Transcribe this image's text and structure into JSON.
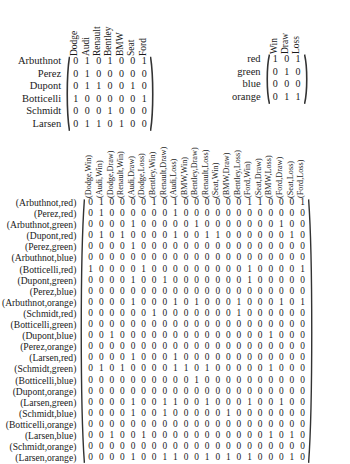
{
  "matrix_driver_car": {
    "name": "driver-car-incidence-matrix",
    "row_labels": [
      "Arbuthnot",
      "Perez",
      "Dupont",
      "Botticelli",
      "Schmidt",
      "Larsen"
    ],
    "col_labels": [
      "Dodge",
      "Audi",
      "Renault",
      "Bentley",
      "BMW",
      "Seat",
      "Ford"
    ],
    "values": [
      [
        0,
        1,
        0,
        1,
        0,
        0,
        1
      ],
      [
        0,
        1,
        0,
        0,
        0,
        0,
        0
      ],
      [
        0,
        1,
        1,
        0,
        0,
        1,
        0
      ],
      [
        1,
        0,
        0,
        0,
        0,
        0,
        1
      ],
      [
        0,
        0,
        0,
        1,
        0,
        0,
        0
      ],
      [
        0,
        1,
        1,
        0,
        1,
        0,
        0
      ]
    ]
  },
  "matrix_color_result": {
    "name": "color-result-incidence-matrix",
    "row_labels": [
      "red",
      "green",
      "blue",
      "orange"
    ],
    "col_labels": [
      "Win",
      "Draw",
      "Loss"
    ],
    "values": [
      [
        1,
        0,
        1
      ],
      [
        0,
        1,
        0
      ],
      [
        0,
        0,
        0
      ],
      [
        0,
        1,
        1
      ]
    ]
  },
  "matrix_pair": {
    "name": "pair-product-incidence-matrix",
    "row_labels": [
      "(Arbuthnot,red)",
      "(Perez,red)",
      "(Arbuthnot,green)",
      "(Dupont,red)",
      "(Perez,green)",
      "(Arbuthnot,blue)",
      "(Botticelli,red)",
      "(Dupont,green)",
      "(Perez,blue)",
      "(Arbuthnot,orange)",
      "(Schmidt,red)",
      "(Botticelli,green)",
      "(Dupont,blue)",
      "(Perez,orange)",
      "(Larsen,red)",
      "(Schmidt,green)",
      "(Botticelli,blue)",
      "(Dupont,orange)",
      "(Larsen,green)",
      "(Schmidt,blue)",
      "(Botticelli,orange)",
      "(Larsen,blue)",
      "(Schmidt,orange)",
      "(Larsen,orange)"
    ],
    "col_labels": [
      "(Dodge,Win)",
      "(Audi,Win)",
      "(Dodge,Draw)",
      "(Renault,Win)",
      "(Audi,Draw)",
      "(Dodge,Loss)",
      "(Bentley,Win)",
      "(Renault,Draw)",
      "(Audi,Loss)",
      "(BMW,Win)",
      "(Bentley,Draw)",
      "(Renault,Loss)",
      "(Seat,Win)",
      "(BMW,Draw)",
      "(Bentley,Loss)",
      "(Ford,Win)",
      "(Seat,Draw)",
      "(BMW,Loss)",
      "(Ford,Draw)",
      "(Seat,Loss)",
      "(Ford,Loss)"
    ],
    "values": [
      [
        0,
        1,
        0,
        0,
        0,
        0,
        1,
        0,
        1,
        0,
        0,
        0,
        0,
        0,
        0,
        1,
        1,
        0,
        0,
        0,
        1
      ],
      [
        0,
        1,
        0,
        0,
        0,
        0,
        0,
        0,
        1,
        0,
        0,
        0,
        0,
        0,
        0,
        0,
        0,
        0,
        0,
        0,
        0
      ],
      [
        0,
        0,
        0,
        0,
        1,
        0,
        0,
        0,
        0,
        0,
        1,
        0,
        0,
        0,
        0,
        0,
        0,
        0,
        1,
        0,
        0
      ],
      [
        0,
        1,
        0,
        1,
        0,
        0,
        0,
        0,
        1,
        0,
        0,
        1,
        1,
        0,
        0,
        0,
        0,
        0,
        0,
        1,
        0
      ],
      [
        0,
        0,
        0,
        0,
        1,
        0,
        0,
        0,
        0,
        0,
        0,
        0,
        0,
        0,
        0,
        0,
        0,
        0,
        0,
        0,
        0
      ],
      [
        0,
        0,
        0,
        0,
        0,
        0,
        0,
        0,
        0,
        0,
        0,
        0,
        0,
        0,
        0,
        0,
        0,
        0,
        0,
        0,
        0
      ],
      [
        1,
        0,
        0,
        0,
        0,
        1,
        0,
        0,
        0,
        0,
        0,
        0,
        0,
        0,
        0,
        1,
        0,
        0,
        0,
        0,
        1
      ],
      [
        0,
        0,
        0,
        0,
        1,
        0,
        0,
        1,
        0,
        0,
        0,
        0,
        0,
        0,
        0,
        1,
        0,
        0,
        0,
        0,
        0
      ],
      [
        0,
        0,
        0,
        0,
        0,
        0,
        0,
        0,
        0,
        0,
        0,
        0,
        0,
        0,
        0,
        0,
        0,
        0,
        0,
        0,
        0
      ],
      [
        0,
        0,
        0,
        0,
        1,
        0,
        0,
        0,
        1,
        0,
        1,
        0,
        0,
        0,
        1,
        0,
        0,
        0,
        1,
        0,
        1
      ],
      [
        0,
        0,
        0,
        0,
        0,
        0,
        1,
        0,
        0,
        0,
        0,
        0,
        0,
        0,
        1,
        0,
        0,
        0,
        0,
        0,
        0
      ],
      [
        0,
        0,
        0,
        0,
        0,
        0,
        0,
        0,
        0,
        0,
        0,
        0,
        0,
        0,
        0,
        0,
        0,
        0,
        0,
        0,
        0
      ],
      [
        0,
        0,
        1,
        0,
        0,
        0,
        0,
        0,
        0,
        0,
        0,
        0,
        0,
        0,
        0,
        0,
        0,
        1,
        0,
        0,
        0
      ],
      [
        0,
        0,
        0,
        0,
        0,
        0,
        0,
        0,
        0,
        0,
        0,
        0,
        0,
        0,
        0,
        0,
        0,
        0,
        0,
        0,
        0
      ],
      [
        0,
        0,
        0,
        0,
        1,
        0,
        0,
        0,
        1,
        0,
        0,
        0,
        0,
        0,
        0,
        0,
        0,
        0,
        0,
        0,
        0
      ],
      [
        0,
        1,
        0,
        1,
        0,
        0,
        0,
        0,
        1,
        1,
        0,
        1,
        0,
        0,
        0,
        0,
        0,
        1,
        0,
        0,
        0
      ],
      [
        0,
        0,
        0,
        0,
        0,
        0,
        0,
        0,
        0,
        0,
        1,
        0,
        0,
        0,
        0,
        0,
        0,
        0,
        0,
        0,
        0
      ],
      [
        0,
        0,
        0,
        0,
        0,
        0,
        0,
        0,
        0,
        0,
        0,
        0,
        0,
        0,
        0,
        0,
        0,
        0,
        0,
        0,
        0
      ],
      [
        0,
        0,
        0,
        0,
        1,
        0,
        0,
        1,
        1,
        0,
        0,
        1,
        0,
        0,
        0,
        1,
        0,
        0,
        1,
        0,
        0
      ],
      [
        0,
        0,
        0,
        0,
        1,
        0,
        0,
        1,
        0,
        0,
        0,
        0,
        0,
        1,
        0,
        0,
        0,
        0,
        0,
        0,
        0
      ],
      [
        0,
        0,
        0,
        0,
        0,
        0,
        0,
        0,
        0,
        0,
        0,
        0,
        0,
        0,
        0,
        0,
        0,
        0,
        0,
        0,
        0
      ],
      [
        0,
        0,
        1,
        0,
        0,
        1,
        0,
        0,
        0,
        0,
        0,
        0,
        0,
        0,
        0,
        0,
        0,
        1,
        0,
        1,
        0
      ],
      [
        0,
        0,
        0,
        0,
        0,
        0,
        0,
        0,
        0,
        0,
        0,
        0,
        0,
        0,
        0,
        0,
        0,
        0,
        0,
        0,
        0
      ],
      [
        0,
        0,
        0,
        0,
        1,
        0,
        0,
        1,
        1,
        0,
        0,
        1,
        0,
        1,
        0,
        1,
        0,
        0,
        0,
        1,
        0
      ]
    ]
  }
}
